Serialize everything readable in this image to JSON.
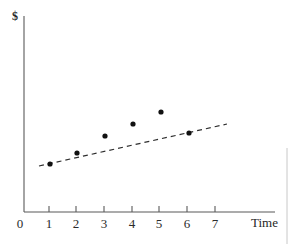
{
  "figure": {
    "width": 294,
    "height": 244,
    "background": "#ffffff"
  },
  "axes": {
    "y_axis_title": "$",
    "x_axis_title": "Time",
    "origin_label": "0",
    "x_tick_labels": [
      "1",
      "2",
      "3",
      "4",
      "5",
      "6",
      "7"
    ],
    "y_tick_labels": [],
    "axis_color": "#595959",
    "origin_px": {
      "x": 24,
      "y": 212
    },
    "x_axis_end_px": 275,
    "y_axis_top_px": 16
  },
  "marks": {
    "point_color": "#111111",
    "point_radius": 2.6,
    "trendline_color": "#2e2e2e",
    "trendline_dash": "5 4",
    "trendline_width": 1.2
  },
  "artifact": {
    "name": "page-edge-line",
    "color": "#c8c8c8",
    "x": 287,
    "y_start": 148,
    "y_end": 244
  },
  "chart_data": {
    "type": "scatter",
    "title": "",
    "subtitle": "",
    "xlabel": "Time",
    "ylabel": "$",
    "grid": false,
    "legend": false,
    "xlim": [
      0,
      7.9
    ],
    "ylim": [
      0,
      7.1
    ],
    "xticks": [
      1,
      2,
      3,
      4,
      5,
      6,
      7
    ],
    "yticks": [],
    "series": [
      {
        "name": "observed",
        "type": "scatter",
        "x": [
          1,
          2,
          3,
          4,
          5,
          6
        ],
        "y": [
          1.3,
          1.6,
          2.0,
          2.4,
          2.75,
          2.2
        ],
        "points_px": [
          {
            "x": 50,
            "y": 164
          },
          {
            "x": 77,
            "y": 153
          },
          {
            "x": 105,
            "y": 136
          },
          {
            "x": 133,
            "y": 124
          },
          {
            "x": 161,
            "y": 112
          },
          {
            "x": 189,
            "y": 133
          }
        ]
      },
      {
        "name": "trend",
        "type": "line",
        "style": "dashed",
        "x": [
          0.55,
          7.35
        ],
        "y": [
          1.22,
          2.55
        ],
        "endpoints_px": [
          {
            "x": 39,
            "y": 166
          },
          {
            "x": 227,
            "y": 124
          }
        ]
      }
    ],
    "annotations": []
  }
}
